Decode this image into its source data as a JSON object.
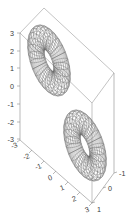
{
  "figure": {
    "background_color": "#ffffff",
    "line_color": "#5a5a5a",
    "axis_color": "#8a8a8a",
    "label_color": "#3a3a3a"
  },
  "chart_data": {
    "type": "line",
    "title": "",
    "subtitle": "",
    "xlabel": "",
    "ylabel": "",
    "zlabel": "",
    "render": "3d-mesh-wireframe",
    "surface": "double-torus",
    "grid": false,
    "legend": null,
    "projection": {
      "azimuth_deg": -37.5,
      "elevation_deg": 30
    },
    "axes": {
      "x": {
        "ticks": [
          -3,
          -2,
          -1,
          0,
          1,
          2,
          3
        ],
        "tick_labels": [
          "-3",
          "-2",
          "-1",
          "0",
          "1",
          "2",
          "3"
        ],
        "lim": [
          -3,
          3
        ]
      },
      "y": {
        "ticks": [
          -1,
          0,
          1
        ],
        "tick_labels": [
          "-1",
          "0",
          "1"
        ],
        "lim": [
          -1,
          1
        ]
      },
      "z": {
        "ticks": [
          3,
          2,
          1,
          0,
          -1,
          -2,
          -3
        ],
        "tick_labels": [
          "3",
          "2",
          "1",
          "0",
          "-1",
          "-2",
          "-3"
        ],
        "lim": [
          -3,
          3
        ]
      }
    },
    "series": [
      {
        "name": "torus-lobe-upper-left",
        "center": [
          -1.5,
          0,
          1.5
        ],
        "major_radius": 1.2,
        "minor_radius": 0.62,
        "u_lines": 28,
        "v_lines": 22
      },
      {
        "name": "torus-lobe-lower-right",
        "center": [
          1.5,
          0,
          -1.5
        ],
        "major_radius": 1.2,
        "minor_radius": 0.62,
        "u_lines": 28,
        "v_lines": 22
      }
    ],
    "annotations": []
  }
}
